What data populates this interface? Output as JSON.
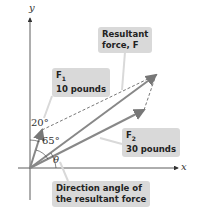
{
  "diagram": {
    "axes": {
      "x_label": "x",
      "y_label": "y"
    },
    "vectors": {
      "f1": {
        "name": "F",
        "subscript": "1",
        "magnitude": "10 pounds"
      },
      "f2": {
        "name": "F",
        "subscript": "2",
        "magnitude": "30 pounds"
      },
      "resultant": {
        "line1": "Resultant",
        "line2": "force, F"
      }
    },
    "angles": {
      "a1": "20°",
      "a2": "65°",
      "theta": "θ"
    },
    "callouts": {
      "direction_line1": "Direction angle of",
      "direction_line2": "the resultant force"
    },
    "colors": {
      "vector": "#8a8a8a",
      "axis": "#333333",
      "callout_bg": "#d9d9d9",
      "dashed": "#555555"
    }
  }
}
